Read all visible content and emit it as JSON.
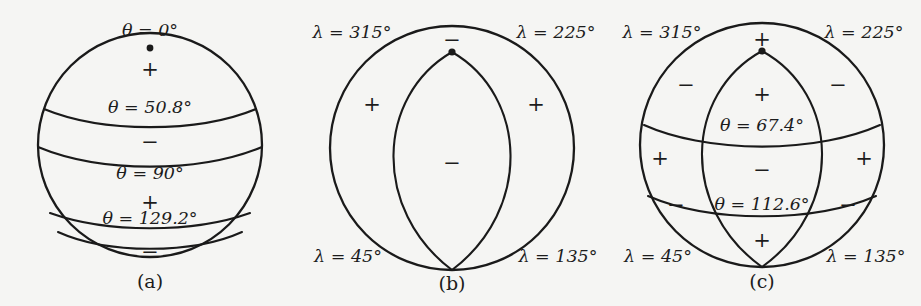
{
  "figure": {
    "background_color": "#f5f5f3",
    "ink_color": "#1a1a1a",
    "panels": [
      {
        "id": "a",
        "caption": "(a)",
        "type": "zonal",
        "sphere": {
          "cx": 150,
          "cy": 145,
          "r": 112
        },
        "pole_dot": {
          "label": "pole-marker",
          "x": 150,
          "y": 48
        },
        "nodal_latitudes": [
          {
            "label": "θ = 0°",
            "theta_text": "0°",
            "x": 150,
            "y": 36
          },
          {
            "label": "θ = 50.8°",
            "theta_text": "50.8°",
            "x": 150,
            "y": 113
          },
          {
            "label": "θ = 90°",
            "theta_text": "90°",
            "x": 150,
            "y": 179
          },
          {
            "label": "θ = 129.2°",
            "theta_text": "129.2°",
            "x": 150,
            "y": 224
          }
        ],
        "signs": [
          {
            "symbol": "+",
            "x": 150,
            "y": 70
          },
          {
            "symbol": "−",
            "x": 150,
            "y": 143
          },
          {
            "symbol": "+",
            "x": 150,
            "y": 203
          },
          {
            "symbol": "−",
            "x": 150,
            "y": 253
          }
        ]
      },
      {
        "id": "b",
        "caption": "(b)",
        "type": "sectoral",
        "sphere": {
          "cx": 152,
          "cy": 148,
          "r": 122
        },
        "pole_dot": {
          "label": "node-crossing-marker",
          "x": 152,
          "y": 52
        },
        "nodal_meridians": [
          {
            "label": "λ = 315°",
            "lambda_text": "315°",
            "x": 52,
            "y": 32
          },
          {
            "label": "λ = 225°",
            "lambda_text": "225°",
            "x": 252,
            "y": 32
          },
          {
            "label": "λ = 45°",
            "lambda_text": "45°",
            "x": 48,
            "y": 257
          },
          {
            "label": "λ = 135°",
            "lambda_text": "135°",
            "x": 256,
            "y": 257
          }
        ],
        "signs": [
          {
            "symbol": "−",
            "x": 152,
            "y": 41
          },
          {
            "symbol": "+",
            "x": 72,
            "y": 104
          },
          {
            "symbol": "+",
            "x": 236,
            "y": 104
          },
          {
            "symbol": "−",
            "x": 152,
            "y": 163
          }
        ]
      },
      {
        "id": "c",
        "caption": "(c)",
        "type": "tesseral",
        "sphere": {
          "cx": 152,
          "cy": 145,
          "r": 122
        },
        "pole_dot": {
          "label": "node-crossing-marker",
          "x": 152,
          "y": 51
        },
        "nodal_latitudes": [
          {
            "label": "θ = 67.4°",
            "theta_text": "67.4°",
            "x": 152,
            "y": 124
          },
          {
            "label": "θ = 112.6°",
            "theta_text": "112.6°",
            "x": 152,
            "y": 203
          }
        ],
        "nodal_meridians": [
          {
            "label": "λ = 315°",
            "lambda_text": "315°",
            "x": 52,
            "y": 32
          },
          {
            "label": "λ = 225°",
            "lambda_text": "225°",
            "x": 252,
            "y": 32
          },
          {
            "label": "λ = 45°",
            "lambda_text": "45°",
            "x": 48,
            "y": 257
          },
          {
            "label": "λ = 135°",
            "lambda_text": "135°",
            "x": 256,
            "y": 257
          }
        ],
        "signs": [
          {
            "symbol": "+",
            "x": 152,
            "y": 40
          },
          {
            "symbol": "−",
            "x": 76,
            "y": 85
          },
          {
            "symbol": "−",
            "x": 228,
            "y": 85
          },
          {
            "symbol": "+",
            "x": 152,
            "y": 95
          },
          {
            "symbol": "+",
            "x": 50,
            "y": 158
          },
          {
            "symbol": "+",
            "x": 254,
            "y": 158
          },
          {
            "symbol": "−",
            "x": 152,
            "y": 170
          },
          {
            "symbol": "−",
            "x": 66,
            "y": 205
          },
          {
            "symbol": "−",
            "x": 238,
            "y": 205
          },
          {
            "symbol": "+",
            "x": 152,
            "y": 240
          }
        ]
      }
    ]
  },
  "symbols": {
    "theta": "θ",
    "lambda": "λ",
    "equals": "=",
    "degree": "°"
  }
}
